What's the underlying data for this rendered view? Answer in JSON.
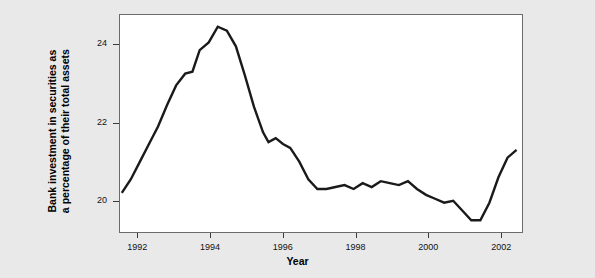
{
  "figure": {
    "background_color": "#e9e9e9",
    "plot_background_color": "#ffffff",
    "line_color": "#1a1a1a",
    "axis_color": "#6b6b6b"
  },
  "axis_titles": {
    "x": "Year",
    "y_line1": "Bank investment in securities as",
    "y_line2": "a percentage of their total assets"
  },
  "chart_data": {
    "type": "line",
    "title": "",
    "subtitle": "",
    "xlabel": "Year",
    "ylabel": "Bank investment in securities as a percentage of their total assets",
    "xlim": [
      1991.5,
      2002.6
    ],
    "ylim": [
      19.2,
      24.75
    ],
    "xticks": [
      1992,
      1994,
      1996,
      1998,
      2000,
      2002
    ],
    "xticklabels": [
      "1992",
      "1994",
      "1996",
      "1998",
      "2000",
      "2002"
    ],
    "yticks": [
      20,
      22,
      24
    ],
    "yticklabels": [
      "20",
      "22",
      "24"
    ],
    "grid": false,
    "legend": null,
    "legend_position": "none",
    "series": [
      {
        "name": "Bank investment in securities (% of total assets)",
        "color": "#1a1a1a",
        "x": [
          1991.55,
          1991.8,
          1992.05,
          1992.3,
          1992.55,
          1992.8,
          1993.05,
          1993.3,
          1993.5,
          1993.7,
          1993.95,
          1994.2,
          1994.45,
          1994.7,
          1994.95,
          1995.2,
          1995.45,
          1995.6,
          1995.8,
          1996.0,
          1996.2,
          1996.45,
          1996.7,
          1996.95,
          1997.2,
          1997.45,
          1997.7,
          1997.95,
          1998.2,
          1998.45,
          1998.7,
          1998.95,
          1999.2,
          1999.45,
          1999.7,
          1999.95,
          2000.2,
          2000.45,
          2000.7,
          2000.95,
          2001.2,
          2001.45,
          2001.7,
          2001.95,
          2002.2,
          2002.45
        ],
        "y": [
          20.2,
          20.55,
          21.0,
          21.45,
          21.9,
          22.45,
          22.95,
          23.25,
          23.3,
          23.85,
          24.05,
          24.45,
          24.35,
          23.95,
          23.2,
          22.4,
          21.75,
          21.5,
          21.6,
          21.45,
          21.35,
          21.0,
          20.55,
          20.3,
          20.3,
          20.35,
          20.4,
          20.3,
          20.45,
          20.35,
          20.5,
          20.45,
          20.4,
          20.5,
          20.3,
          20.15,
          20.05,
          19.95,
          20.0,
          19.75,
          19.5,
          19.5,
          19.95,
          20.6,
          21.1,
          21.3
        ]
      }
    ]
  }
}
